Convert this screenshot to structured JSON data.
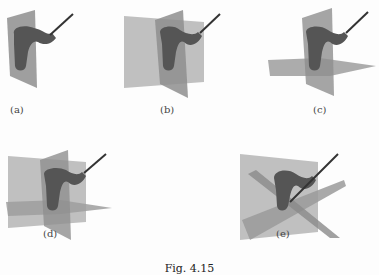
{
  "figure": {
    "caption": "Fig. 4.15",
    "panels": [
      {
        "id": "a",
        "label": "(a)",
        "description": "handle object with one vertical plane"
      },
      {
        "id": "b",
        "label": "(b)",
        "description": "handle object with two vertical planes"
      },
      {
        "id": "c",
        "label": "(c)",
        "description": "handle object with vertical and horizontal plane"
      },
      {
        "id": "d",
        "label": "(d)",
        "description": "handle object with three orthogonal planes"
      },
      {
        "id": "e",
        "label": "(e)",
        "description": "handle object with one plane and two diagonal planes"
      }
    ],
    "colors": {
      "plane_fill": "#9a9a9a",
      "plane_light": "#b8b8b8",
      "object_fill": "#5a5a5a",
      "rod": "#333333",
      "background": "#fdfdfd"
    }
  }
}
